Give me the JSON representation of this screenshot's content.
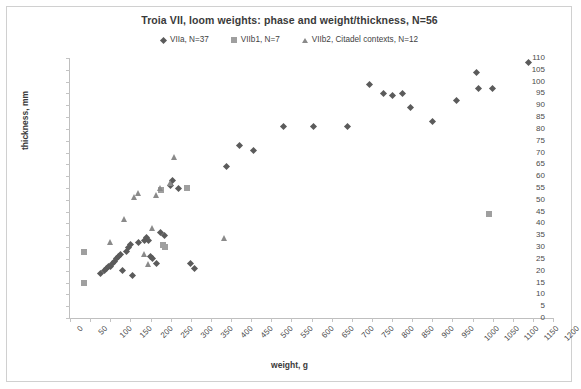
{
  "chart_data": {
    "type": "scatter",
    "title": "Troia VII, loom weights: phase and weight/thickness, N=56",
    "xlabel": "weight, g",
    "ylabel": "thickness, mm",
    "xlim": [
      0,
      1200
    ],
    "ylim": [
      0,
      110
    ],
    "xticks": [
      0,
      50,
      100,
      150,
      200,
      250,
      300,
      350,
      400,
      450,
      500,
      550,
      600,
      650,
      700,
      750,
      800,
      850,
      900,
      950,
      1000,
      1050,
      1100,
      1150,
      1200
    ],
    "yticks": [
      0,
      5,
      10,
      15,
      20,
      25,
      30,
      35,
      40,
      45,
      50,
      55,
      60,
      65,
      70,
      75,
      80,
      85,
      90,
      95,
      100,
      105,
      110
    ],
    "grid": false,
    "legend_position": "top-center",
    "series": [
      {
        "name": "VIIa, N=37",
        "marker": "diamond",
        "color": "#5b5b5b",
        "points": [
          [
            75,
            19
          ],
          [
            85,
            20
          ],
          [
            90,
            21
          ],
          [
            95,
            22
          ],
          [
            100,
            22
          ],
          [
            105,
            23
          ],
          [
            110,
            24
          ],
          [
            115,
            25
          ],
          [
            120,
            26
          ],
          [
            125,
            27
          ],
          [
            130,
            20
          ],
          [
            140,
            28
          ],
          [
            145,
            30
          ],
          [
            150,
            31
          ],
          [
            155,
            18
          ],
          [
            170,
            32
          ],
          [
            185,
            33
          ],
          [
            190,
            34
          ],
          [
            195,
            33
          ],
          [
            200,
            26
          ],
          [
            205,
            25
          ],
          [
            215,
            23
          ],
          [
            225,
            36
          ],
          [
            235,
            35
          ],
          [
            250,
            56
          ],
          [
            255,
            58
          ],
          [
            270,
            55
          ],
          [
            300,
            23
          ],
          [
            310,
            21
          ],
          [
            390,
            64
          ],
          [
            420,
            73
          ],
          [
            455,
            71
          ],
          [
            530,
            81
          ],
          [
            605,
            81
          ],
          [
            690,
            81
          ],
          [
            745,
            99
          ],
          [
            780,
            95
          ],
          [
            800,
            94
          ],
          [
            825,
            95
          ],
          [
            845,
            89
          ],
          [
            900,
            83
          ],
          [
            960,
            92
          ],
          [
            1010,
            104
          ],
          [
            1015,
            97
          ],
          [
            1050,
            97
          ],
          [
            1140,
            108
          ]
        ]
      },
      {
        "name": "VIIb1, N=7",
        "marker": "square",
        "color": "#9f9f9f",
        "points": [
          [
            35,
            15
          ],
          [
            35,
            28
          ],
          [
            225,
            54
          ],
          [
            230,
            31
          ],
          [
            235,
            30
          ],
          [
            290,
            55
          ],
          [
            1040,
            44
          ]
        ]
      },
      {
        "name": "VIIb2, Citadel contexts, N=12",
        "marker": "triangle",
        "color": "#8a8a8a",
        "points": [
          [
            100,
            32
          ],
          [
            135,
            42
          ],
          [
            160,
            51
          ],
          [
            170,
            53
          ],
          [
            185,
            27
          ],
          [
            195,
            23
          ],
          [
            205,
            38
          ],
          [
            215,
            52
          ],
          [
            225,
            55
          ],
          [
            250,
            57
          ],
          [
            260,
            68
          ],
          [
            385,
            34
          ]
        ]
      }
    ]
  }
}
